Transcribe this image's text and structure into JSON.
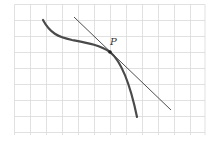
{
  "figure": {
    "grid": {
      "x0": 14.5,
      "y0": 4.5,
      "cell": 16,
      "cols": 12,
      "rows": 8,
      "right": 205,
      "bottom": 135,
      "color": "#d9d9d9"
    },
    "curve": {
      "color": "#4a4a4a",
      "width": 2.2,
      "path": "M43,20 C50,33 58,37 72,40 C88,43 100,45 110,52 C122,62 131,88 137,117"
    },
    "tangent": {
      "color": "#3a3a3a",
      "width": 0.9,
      "x1": 74,
      "y1": 17,
      "x2": 171,
      "y2": 110
    },
    "point": {
      "label": "P",
      "x": 110,
      "y": 52,
      "label_x": 110,
      "label_y": 45
    }
  }
}
